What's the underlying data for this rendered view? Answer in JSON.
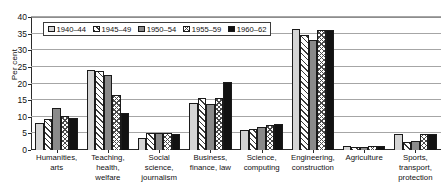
{
  "chart_data": {
    "type": "bar",
    "title": "",
    "xlabel": "",
    "ylabel": "Per cent",
    "ylim": [
      0,
      40
    ],
    "yticks": [
      0,
      5,
      10,
      15,
      20,
      25,
      30,
      35,
      40
    ],
    "grid": true,
    "legend_position": "top-left",
    "categories": [
      "Humanities, arts",
      "Teaching, health, welfare",
      "Social science, journalism",
      "Business, finance, law",
      "Science, computing",
      "Engineering, construction",
      "Agriculture",
      "Sports, transport, protection"
    ],
    "category_lines": [
      [
        "Humanities,",
        "arts"
      ],
      [
        "Teaching,",
        "health,",
        "welfare"
      ],
      [
        "Social science,",
        "journalism"
      ],
      [
        "Business,",
        "finance, law"
      ],
      [
        "Science,",
        "computing"
      ],
      [
        "Engineering,",
        "construction"
      ],
      [
        "Agriculture"
      ],
      [
        "Sports,",
        "transport,",
        "protection"
      ]
    ],
    "series": [
      {
        "name": "1940-44",
        "pattern": "light-grey-solid",
        "color": "#d4d4d4",
        "values": [
          8.0,
          24.0,
          3.7,
          14.1,
          6.1,
          36.3,
          1.3,
          4.7
        ]
      },
      {
        "name": "1945-49",
        "pattern": "diagonal-hatch",
        "color": "#ffffff",
        "values": [
          9.4,
          23.8,
          5.1,
          15.6,
          6.4,
          34.6,
          0.9,
          2.4
        ]
      },
      {
        "name": "1950-54",
        "pattern": "dark-grey-solid",
        "color": "#8a8a8a",
        "values": [
          12.6,
          22.5,
          5.2,
          13.8,
          7.0,
          33.0,
          1.0,
          2.6
        ]
      },
      {
        "name": "1955-59",
        "pattern": "cross-hatch",
        "color": "#ffffff",
        "values": [
          10.2,
          16.5,
          5.2,
          15.5,
          7.6,
          36.0,
          1.2,
          4.7
        ]
      },
      {
        "name": "1960-62",
        "pattern": "black-solid",
        "color": "#121212",
        "values": [
          9.5,
          11.1,
          4.8,
          20.6,
          7.9,
          36.1,
          1.1,
          4.9
        ]
      }
    ]
  }
}
